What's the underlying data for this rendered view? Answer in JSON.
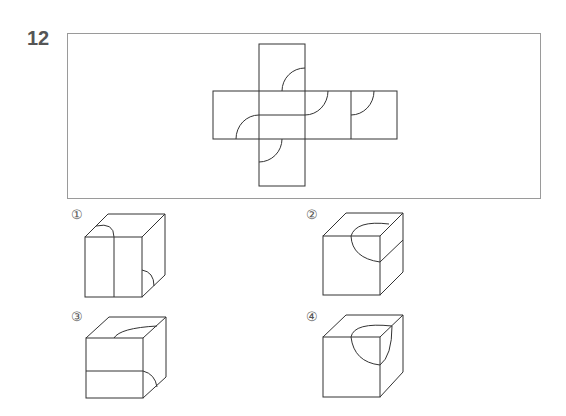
{
  "question": {
    "number": "12"
  },
  "net": {
    "description": "cube net (cross shape) with quarter-arc markings"
  },
  "options": [
    {
      "label": "①",
      "id": 1
    },
    {
      "label": "②",
      "id": 2
    },
    {
      "label": "③",
      "id": 3
    },
    {
      "label": "④",
      "id": 4
    }
  ],
  "colors": {
    "line": "#333333",
    "frame": "#9a9a9a",
    "label": "#555555"
  }
}
